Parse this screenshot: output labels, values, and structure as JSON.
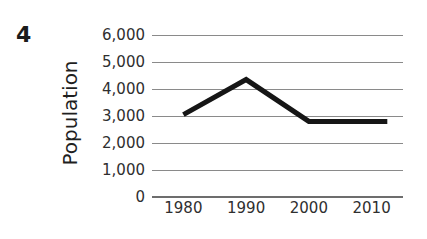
{
  "question": {
    "number": "4"
  },
  "chart_data": {
    "type": "line",
    "title": "",
    "subtitle": "",
    "xlabel": "",
    "ylabel": "Population",
    "grid": true,
    "legend": false,
    "legend_position": "none",
    "xlim": [
      1975,
      2015
    ],
    "ylim": [
      0,
      6000
    ],
    "x": [
      1980,
      1990,
      2000,
      2010,
      2012.5
    ],
    "categories": [
      "1980",
      "1990",
      "2000",
      "2010"
    ],
    "xticks": [
      1980,
      1990,
      2000,
      2010
    ],
    "xtick_labels": [
      "1980",
      "1990",
      "2000",
      "2010"
    ],
    "yticks": [
      0,
      1000,
      2000,
      3000,
      4000,
      5000,
      6000
    ],
    "ytick_labels": [
      "0",
      "1,000",
      "2,000",
      "3,000",
      "4,000",
      "5,000",
      "6,000"
    ],
    "series": [
      {
        "name": "Population",
        "x": [
          1980,
          1990,
          2000,
          2010,
          2012.5
        ],
        "values": [
          3050,
          4350,
          2800,
          2800,
          2800
        ],
        "color": "#161616",
        "line_width": 5
      }
    ]
  },
  "style": {
    "gridline_color": "#8a8a8a",
    "axis_color": "#6d6d6d",
    "line_color": "#161616",
    "text_color": "#2f2f2f",
    "background": "#ffffff"
  }
}
